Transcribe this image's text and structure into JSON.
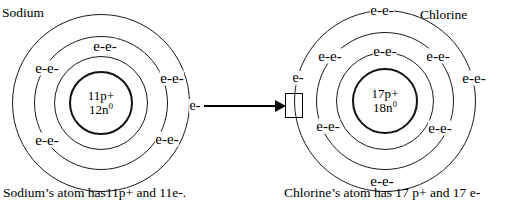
{
  "diagram": {
    "title_left": "Sodium",
    "title_right": "Chlorine",
    "caption_left": "Sodium’s atom has11p+ and 11e-.",
    "caption_right": "Chlorine’s atom has 17 p+ and 17 e-",
    "arrow_meaning": "electron-transfer-arrow"
  },
  "sodium": {
    "name": "Sodium",
    "nucleus_protons": "11p+",
    "nucleus_neutrons_base": "12n",
    "nucleus_neutrons_sup": "0",
    "electron_labels": {
      "inner_top": "e-e-",
      "inner_left": "e-e-",
      "inner_bottom_left": "e-e-",
      "middle_right": "e-e-",
      "middle_bottom_right": "e-e-",
      "valence": "e-"
    }
  },
  "chlorine": {
    "name": "Chlorine",
    "nucleus_protons": "17p+",
    "nucleus_neutrons_base": "18n",
    "nucleus_neutrons_sup": "0",
    "electron_labels": {
      "outer_top": "e-e-",
      "outer_left": "e-",
      "outer_right": "e-e-",
      "outer_bottom": "e-e-",
      "middle_left": "e-e-",
      "middle_top": "e-e-",
      "middle_right": "e-e-",
      "inner_bottom_left": "e-e-",
      "inner_bottom_right": "e-e-"
    }
  },
  "colors": {
    "ink": "#1a1a1a",
    "background": "#ffffff"
  }
}
